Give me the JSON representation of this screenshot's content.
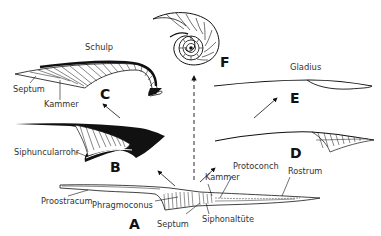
{
  "diagram": {
    "titles": {
      "schulp": "Schulp",
      "gladius": "Gladius"
    },
    "figure_letters": {
      "A": "A",
      "B": "B",
      "C": "C",
      "D": "D",
      "E": "E",
      "F": "F"
    },
    "labels": {
      "c_septum": "Septum",
      "c_kammer": "Kammer",
      "b_siphuncularrohr": "Siphuncularrohr",
      "a_proostracum": "Proostracum",
      "a_phragmoconus": "Phragmoconus",
      "a_septum": "Septum",
      "a_kammer": "Kammer",
      "a_protoconch": "Protoconch",
      "a_siphonaltute": "Siphonaltüte",
      "a_rostrum": "Rostrum"
    },
    "colors": {
      "ink": "#111111",
      "label": "#333333",
      "background": "#ffffff"
    }
  }
}
